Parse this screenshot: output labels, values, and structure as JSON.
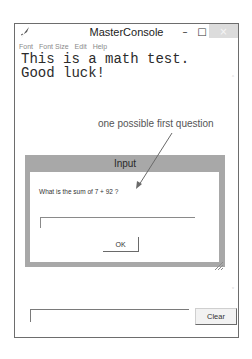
{
  "window": {
    "title": "MasterConsole",
    "controls": {
      "minimize": "–",
      "maximize": "□",
      "close": "×"
    }
  },
  "menubar": {
    "items": [
      {
        "label": "Font"
      },
      {
        "label": "Font Size"
      },
      {
        "label": "Edit"
      },
      {
        "label": "Help"
      }
    ]
  },
  "console": {
    "lines": [
      "This is a math test.",
      "Good luck!"
    ],
    "scroll_up": "˄",
    "scroll_down": "˅"
  },
  "annotation": {
    "text": "one possible first question"
  },
  "dialog": {
    "title": "Input",
    "question": "What is the sum of 7 + 92 ?",
    "input_value": "",
    "ok_label": "OK"
  },
  "bottom": {
    "input_value": "",
    "clear_label": "Clear"
  },
  "colors": {
    "dialog_frame": "#a8a8a8",
    "close_button": "#dcdcdc",
    "window_border": "#6d6d6d"
  }
}
